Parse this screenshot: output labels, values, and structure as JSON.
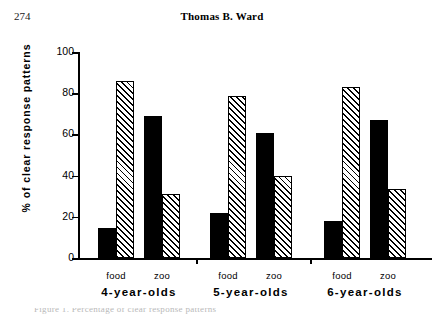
{
  "page": {
    "number": "274",
    "running_head": "Thomas B. Ward",
    "caption_partial": "Figure 1.  Percentage of clear response patterns"
  },
  "chart_data": {
    "type": "bar",
    "title": "",
    "xlabel": "",
    "ylabel": "% of clear response patterns",
    "ylim": [
      0,
      100
    ],
    "ytick_labels": [
      "0",
      "20",
      "40",
      "60",
      "80",
      "100"
    ],
    "ytick_values": [
      0,
      20,
      40,
      60,
      80,
      100
    ],
    "grid": false,
    "legend": "none",
    "categories": [
      "4-year-olds food",
      "4-year-olds zoo",
      "5-year-olds food",
      "5-year-olds zoo",
      "6-year-olds food",
      "6-year-olds zoo"
    ],
    "groups": [
      {
        "label": "4-year-olds",
        "conditions": [
          {
            "label": "food",
            "bars": [
              {
                "fill": "solid",
                "value": 14.5
              },
              {
                "fill": "hatch",
                "value": 86
              }
            ]
          },
          {
            "label": "zoo",
            "bars": [
              {
                "fill": "solid",
                "value": 69
              },
              {
                "fill": "hatch",
                "value": 31
              }
            ]
          }
        ]
      },
      {
        "label": "5-year-olds",
        "conditions": [
          {
            "label": "food",
            "bars": [
              {
                "fill": "solid",
                "value": 22
              },
              {
                "fill": "hatch",
                "value": 78.5
              }
            ]
          },
          {
            "label": "zoo",
            "bars": [
              {
                "fill": "solid",
                "value": 60.5
              },
              {
                "fill": "hatch",
                "value": 40
              }
            ]
          }
        ]
      },
      {
        "label": "6-year-olds",
        "conditions": [
          {
            "label": "food",
            "bars": [
              {
                "fill": "solid",
                "value": 18
              },
              {
                "fill": "hatch",
                "value": 83
              }
            ]
          },
          {
            "label": "zoo",
            "bars": [
              {
                "fill": "solid",
                "value": 67
              },
              {
                "fill": "hatch",
                "value": 33.5
              }
            ]
          }
        ]
      }
    ],
    "series": [
      {
        "name": "solid",
        "values": [
          14.5,
          69,
          22,
          60.5,
          18,
          67
        ]
      },
      {
        "name": "hatched",
        "values": [
          86,
          31,
          78.5,
          40,
          83,
          33.5
        ]
      }
    ],
    "colors": {
      "solid_fill": "#000000",
      "hatch_fill": "#ffffff",
      "hatch_line": "#000000",
      "axis": "#000000",
      "background": "#ffffff"
    }
  }
}
